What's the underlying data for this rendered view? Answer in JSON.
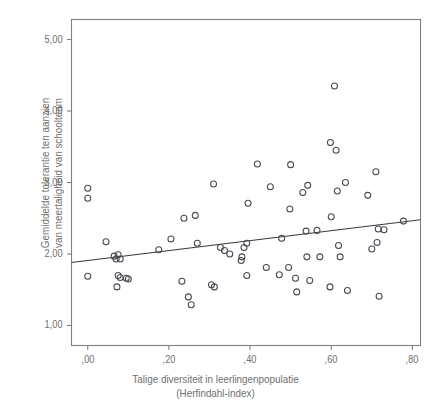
{
  "chart_data": {
    "type": "scatter",
    "title": "",
    "xlabel": "Talige diversiteit in leerlingenpopulatie (Herfindahl-index)",
    "xlabel_line1": "Talige diversiteit in leerlingenpopulatie",
    "xlabel_line2": "(Herfindahl-index)",
    "ylabel": "Gemiddelde tolerantie ten aanzien van meertaligheid van schoolteam",
    "ylabel_line1": "Gemiddelde tolerantie ten aanzien",
    "ylabel_line2": "van meertaligheid van schoolteam",
    "xlim": [
      -0.04,
      0.82
    ],
    "ylim": [
      0.72,
      5.28
    ],
    "xticks": [
      0.0,
      0.2,
      0.4,
      0.6,
      0.8
    ],
    "xtick_labels": [
      ",00",
      ",20",
      ",40",
      ",60",
      ",80"
    ],
    "yticks": [
      1.0,
      2.0,
      3.0,
      4.0,
      5.0
    ],
    "ytick_labels": [
      "1,00",
      "2,00",
      "3,00",
      "4,00",
      "5,00"
    ],
    "grid": false,
    "legend": null,
    "marker": "open-circle",
    "marker_color": "#4a4a55",
    "marker_size": 6,
    "frame_color": "#808080",
    "line_color": "#3a3a3a",
    "trendline": {
      "type": "linear-fit",
      "x_start": -0.04,
      "y_start": 1.88,
      "x_end": 0.82,
      "y_end": 2.48,
      "slope": 0.7,
      "intercept": 1.908
    },
    "points": [
      {
        "x": 0.0,
        "y": 2.92
      },
      {
        "x": 0.0,
        "y": 2.78
      },
      {
        "x": 0.0,
        "y": 1.69
      },
      {
        "x": 0.045,
        "y": 2.17
      },
      {
        "x": 0.065,
        "y": 1.97
      },
      {
        "x": 0.07,
        "y": 1.93
      },
      {
        "x": 0.075,
        "y": 1.99
      },
      {
        "x": 0.08,
        "y": 1.93
      },
      {
        "x": 0.075,
        "y": 1.7
      },
      {
        "x": 0.08,
        "y": 1.67
      },
      {
        "x": 0.072,
        "y": 1.54
      },
      {
        "x": 0.095,
        "y": 1.66
      },
      {
        "x": 0.1,
        "y": 1.65
      },
      {
        "x": 0.175,
        "y": 2.06
      },
      {
        "x": 0.205,
        "y": 2.21
      },
      {
        "x": 0.237,
        "y": 2.5
      },
      {
        "x": 0.232,
        "y": 1.62
      },
      {
        "x": 0.248,
        "y": 1.4
      },
      {
        "x": 0.255,
        "y": 1.29
      },
      {
        "x": 0.265,
        "y": 2.54
      },
      {
        "x": 0.27,
        "y": 2.15
      },
      {
        "x": 0.31,
        "y": 2.98
      },
      {
        "x": 0.305,
        "y": 1.57
      },
      {
        "x": 0.312,
        "y": 1.54
      },
      {
        "x": 0.327,
        "y": 2.09
      },
      {
        "x": 0.337,
        "y": 2.05
      },
      {
        "x": 0.35,
        "y": 2.0
      },
      {
        "x": 0.38,
        "y": 1.96
      },
      {
        "x": 0.378,
        "y": 1.91
      },
      {
        "x": 0.385,
        "y": 2.09
      },
      {
        "x": 0.392,
        "y": 2.15
      },
      {
        "x": 0.395,
        "y": 2.71
      },
      {
        "x": 0.392,
        "y": 1.7
      },
      {
        "x": 0.418,
        "y": 3.26
      },
      {
        "x": 0.44,
        "y": 1.81
      },
      {
        "x": 0.45,
        "y": 2.94
      },
      {
        "x": 0.478,
        "y": 2.22
      },
      {
        "x": 0.472,
        "y": 1.71
      },
      {
        "x": 0.495,
        "y": 1.81
      },
      {
        "x": 0.5,
        "y": 3.25
      },
      {
        "x": 0.498,
        "y": 2.63
      },
      {
        "x": 0.512,
        "y": 1.66
      },
      {
        "x": 0.515,
        "y": 1.47
      },
      {
        "x": 0.53,
        "y": 2.86
      },
      {
        "x": 0.538,
        "y": 2.32
      },
      {
        "x": 0.54,
        "y": 1.96
      },
      {
        "x": 0.542,
        "y": 2.96
      },
      {
        "x": 0.547,
        "y": 1.63
      },
      {
        "x": 0.565,
        "y": 2.33
      },
      {
        "x": 0.572,
        "y": 1.96
      },
      {
        "x": 0.598,
        "y": 3.56
      },
      {
        "x": 0.6,
        "y": 2.52
      },
      {
        "x": 0.597,
        "y": 1.54
      },
      {
        "x": 0.608,
        "y": 4.35
      },
      {
        "x": 0.612,
        "y": 3.45
      },
      {
        "x": 0.615,
        "y": 2.88
      },
      {
        "x": 0.618,
        "y": 2.12
      },
      {
        "x": 0.622,
        "y": 1.96
      },
      {
        "x": 0.635,
        "y": 3.0
      },
      {
        "x": 0.64,
        "y": 1.49
      },
      {
        "x": 0.69,
        "y": 2.82
      },
      {
        "x": 0.7,
        "y": 2.07
      },
      {
        "x": 0.71,
        "y": 3.15
      },
      {
        "x": 0.713,
        "y": 2.16
      },
      {
        "x": 0.716,
        "y": 2.35
      },
      {
        "x": 0.718,
        "y": 1.41
      },
      {
        "x": 0.73,
        "y": 2.34
      },
      {
        "x": 0.778,
        "y": 2.46
      }
    ]
  }
}
